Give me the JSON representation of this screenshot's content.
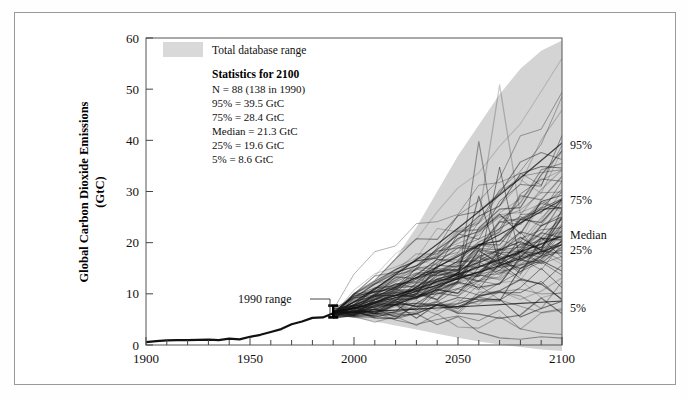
{
  "figure": {
    "background": "#ffffff",
    "frame_color": "#9a9a9a"
  },
  "legend": {
    "swatch_color": "#d9d9d9",
    "swatch_label": "Total database range",
    "stats_title": "Statistics for 2100",
    "stats_lines": [
      "N = 88  (138 in 1990)",
      "95% = 39.5 GtC",
      "75% = 28.4 GtC",
      "Median = 21.3 GtC",
      "25% = 19.6 GtC",
      "5% = 8.6 GtC"
    ]
  },
  "annotations": {
    "range_1990": "1990 range",
    "right_labels": [
      {
        "text": "95%",
        "value": 39.5
      },
      {
        "text": "75%",
        "value": 28.4
      },
      {
        "text": "Median",
        "value": 21.3
      },
      {
        "text": "25%",
        "value": 19.6
      },
      {
        "text": "5%",
        "value": 8.6
      }
    ]
  },
  "chart_data": {
    "type": "line",
    "title": "",
    "xlabel": "",
    "ylabel": "Global Carbon Dioxide Emissions (GtC)",
    "ylabel_lines": [
      "Global Carbon Dioxide Emissions",
      "(GtC)"
    ],
    "xlim": [
      1900,
      2100
    ],
    "ylim": [
      0,
      60
    ],
    "xticks": [
      1900,
      1950,
      2000,
      2050,
      2100
    ],
    "xtick_labels": [
      "1900",
      "1950",
      "2000",
      "2050",
      "2100"
    ],
    "x_minor_step": 10,
    "yticks": [
      0,
      10,
      20,
      30,
      40,
      50,
      60
    ],
    "ytick_labels": [
      "0",
      "10",
      "20",
      "30",
      "40",
      "50",
      "60"
    ],
    "y_minor_step": 10,
    "grid": false,
    "legend_position": "top-left-inside",
    "line_color": "#1a1a1a",
    "band_color": "#d4d4d4",
    "historical": {
      "name": "Historical global CO2 emissions",
      "x": [
        1900,
        1905,
        1910,
        1915,
        1920,
        1925,
        1930,
        1935,
        1940,
        1945,
        1950,
        1955,
        1960,
        1965,
        1970,
        1975,
        1980,
        1985,
        1990
      ],
      "y": [
        0.55,
        0.75,
        0.9,
        0.95,
        0.95,
        1.0,
        1.05,
        0.95,
        1.25,
        1.1,
        1.6,
        2.0,
        2.55,
        3.1,
        4.05,
        4.6,
        5.3,
        5.4,
        6.2
      ]
    },
    "range_1990_errorbar": {
      "x": 1990,
      "low": 5.4,
      "high": 7.7,
      "center": 6.4
    },
    "band_total_range": {
      "name": "Total database range",
      "x": [
        1990,
        2000,
        2010,
        2020,
        2030,
        2040,
        2050,
        2060,
        2070,
        2080,
        2090,
        2100
      ],
      "upper": [
        6.8,
        9.0,
        12.5,
        17.0,
        23.0,
        30.0,
        37.0,
        43.0,
        49.0,
        54.0,
        57.5,
        59.5
      ],
      "lower": [
        6.0,
        5.3,
        4.6,
        3.8,
        3.0,
        2.2,
        1.4,
        0.7,
        0.1,
        -0.4,
        -0.9,
        -1.2
      ]
    },
    "percentile_2100": {
      "p95": 39.5,
      "p75": 28.4,
      "median": 21.3,
      "p25": 19.6,
      "p5": 8.6
    },
    "scenario_count_2100": 88,
    "scenario_count_1990": 138,
    "scenarios_note": "88 scenario trajectories fanning out from the 1990 range to 2100"
  }
}
